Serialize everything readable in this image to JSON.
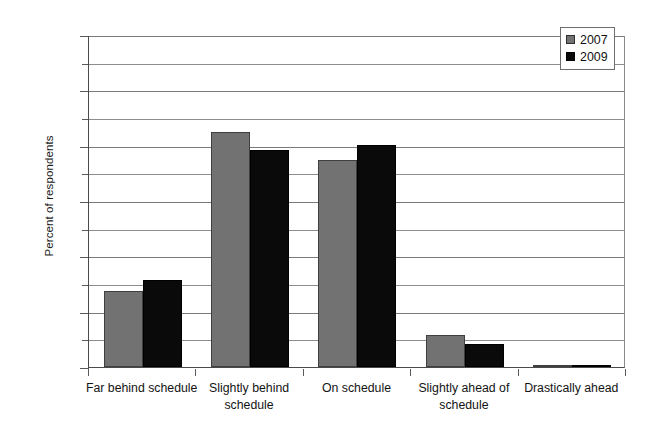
{
  "chart_data": {
    "type": "bar",
    "title": "",
    "xlabel": "",
    "ylabel": "Percent of respondents",
    "categories": [
      "Far behind schedule",
      "Slightly behind schedule",
      "On schedule",
      "Slightly ahead of schedule",
      "Drastically ahead"
    ],
    "series": [
      {
        "name": "2007",
        "color": "#727272",
        "values": [
          13.7,
          42.5,
          37.4,
          5.8,
          0.3
        ]
      },
      {
        "name": "2009",
        "color": "#0a0a0a",
        "values": [
          15.8,
          39.2,
          40.1,
          4.1,
          0.2
        ]
      }
    ],
    "ylim": [
      0,
      60
    ],
    "ytick_labels": [
      "0%",
      "10%",
      "20%",
      "30%",
      "40%",
      "50%",
      "60%"
    ],
    "ytick_values": [
      0,
      10,
      20,
      30,
      40,
      50,
      60
    ],
    "yminor_values": [
      5,
      15,
      25,
      35,
      45,
      55
    ],
    "grid": true,
    "legend_position": "top-right",
    "value_suffix": "%"
  },
  "legend": {
    "entries": [
      {
        "label": "2007"
      },
      {
        "label": "2009"
      }
    ]
  }
}
